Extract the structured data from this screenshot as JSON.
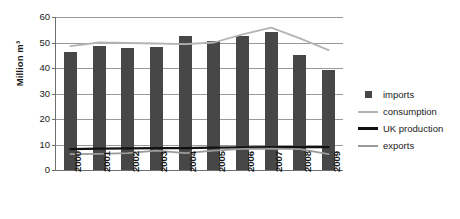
{
  "chart_data": {
    "type": "bar",
    "title": "",
    "xlabel": "",
    "ylabel": "Million m³",
    "ylim": [
      0,
      60
    ],
    "yticks": [
      0,
      10,
      20,
      30,
      40,
      50,
      60
    ],
    "ytick_labels": [
      "0",
      "10",
      "20",
      "30",
      "40",
      "50",
      "60"
    ],
    "grid": true,
    "legend_position": "right",
    "categories": [
      "2000",
      "2001",
      "2002",
      "2003",
      "2004",
      "2005",
      "2006",
      "2007",
      "2008",
      "2009"
    ],
    "series": [
      {
        "name": "imports",
        "type": "bar",
        "color": "#474747",
        "values": [
          46.4,
          48.8,
          48.0,
          48.3,
          52.6,
          50.6,
          52.6,
          54.2,
          45.0,
          39.2
        ]
      },
      {
        "name": "consumption",
        "type": "line",
        "color": "#b4b4b4",
        "values": [
          48.6,
          50.0,
          49.8,
          49.6,
          49.4,
          50.0,
          53.2,
          55.8,
          51.6,
          47.0
        ]
      },
      {
        "name": "UK production",
        "type": "line",
        "color": "#111111",
        "values": [
          8.2,
          8.4,
          8.5,
          8.6,
          8.6,
          8.8,
          8.9,
          9.0,
          9.0,
          9.0
        ]
      },
      {
        "name": "exports",
        "type": "line",
        "color": "#9a9a9a",
        "values": [
          6.2,
          6.3,
          6.6,
          7.6,
          6.6,
          7.6,
          8.3,
          8.4,
          8.2,
          6.2
        ]
      }
    ]
  },
  "legend": {
    "items": [
      {
        "label": "imports",
        "key": "square-marker",
        "color": "#474747"
      },
      {
        "label": "consumption",
        "key": "line-marker",
        "color": "#b4b4b4"
      },
      {
        "label": "UK production",
        "key": "line-marker",
        "color": "#111111"
      },
      {
        "label": "exports",
        "key": "line-marker",
        "color": "#9a9a9a"
      }
    ]
  },
  "axis": {
    "y_title": "Million m³",
    "axis_color": "#6f6f6f",
    "grid_color": "#9a9a9a"
  }
}
